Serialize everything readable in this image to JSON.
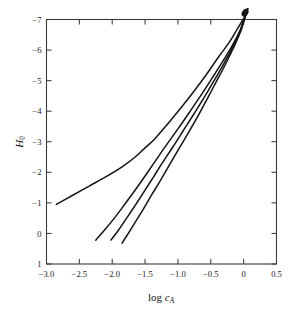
{
  "chart_data": {
    "type": "line",
    "title": "",
    "subtitle": "",
    "xlabel": "log c_A",
    "xlabel_parts": {
      "prefix": "log ",
      "symbol": "c",
      "subscript": "A"
    },
    "ylabel": "H_0",
    "ylabel_parts": {
      "symbol": "H",
      "subscript": "0"
    },
    "xlim": [
      -3.0,
      0.5
    ],
    "ylim": [
      1,
      -7
    ],
    "y_axis_inverted": true,
    "grid": false,
    "legend": null,
    "legend_position": "none",
    "xticks": [
      -3.0,
      -2.5,
      -2.0,
      -1.5,
      -1.0,
      -0.5,
      0,
      0.5
    ],
    "xtick_labels": [
      "-3.0",
      "-2.5",
      "-2.0",
      "-1.5",
      "-1.0",
      "-0.5",
      "0",
      "0.5"
    ],
    "yticks": [
      -7,
      -6,
      -5,
      -4,
      -3,
      -2,
      -1,
      0,
      1
    ],
    "ytick_labels": [
      "-7",
      "-6",
      "-5",
      "-4",
      "-3",
      "-2",
      "-1",
      "0",
      "1"
    ],
    "tick_direction": "in",
    "ticks_on_all_sides": true,
    "line_color": "#141414",
    "axis_color": "#3b3b3b",
    "background_color": "#ffffff",
    "convergence_point": {
      "x": 0.06,
      "y": -7.35
    },
    "series": [
      {
        "name": "curve-1",
        "points": [
          [
            -2.85,
            -0.95
          ],
          [
            -2.6,
            -1.25
          ],
          [
            -2.35,
            -1.55
          ],
          [
            -2.1,
            -1.85
          ],
          [
            -1.85,
            -2.18
          ],
          [
            -1.65,
            -2.5
          ],
          [
            -1.5,
            -2.8
          ],
          [
            -1.35,
            -3.1
          ],
          [
            -1.15,
            -3.6
          ],
          [
            -0.95,
            -4.12
          ],
          [
            -0.75,
            -4.67
          ],
          [
            -0.55,
            -5.25
          ],
          [
            -0.38,
            -5.78
          ],
          [
            -0.22,
            -6.25
          ],
          [
            -0.08,
            -6.75
          ],
          [
            0.02,
            -7.1
          ],
          [
            0.06,
            -7.35
          ]
        ]
      },
      {
        "name": "curve-2",
        "points": [
          [
            -2.25,
            0.22
          ],
          [
            -2.1,
            -0.15
          ],
          [
            -1.95,
            -0.55
          ],
          [
            -1.8,
            -0.98
          ],
          [
            -1.65,
            -1.42
          ],
          [
            -1.5,
            -1.88
          ],
          [
            -1.35,
            -2.35
          ],
          [
            -1.18,
            -2.88
          ],
          [
            -1.0,
            -3.42
          ],
          [
            -0.82,
            -3.98
          ],
          [
            -0.65,
            -4.52
          ],
          [
            -0.48,
            -5.08
          ],
          [
            -0.32,
            -5.62
          ],
          [
            -0.18,
            -6.12
          ],
          [
            -0.06,
            -6.62
          ],
          [
            0.02,
            -7.08
          ],
          [
            0.06,
            -7.35
          ]
        ]
      },
      {
        "name": "curve-3",
        "points": [
          [
            -2.02,
            0.22
          ],
          [
            -1.9,
            -0.12
          ],
          [
            -1.78,
            -0.5
          ],
          [
            -1.65,
            -0.92
          ],
          [
            -1.52,
            -1.35
          ],
          [
            -1.38,
            -1.82
          ],
          [
            -1.24,
            -2.3
          ],
          [
            -1.08,
            -2.82
          ],
          [
            -0.92,
            -3.36
          ],
          [
            -0.76,
            -3.9
          ],
          [
            -0.6,
            -4.45
          ],
          [
            -0.45,
            -5.0
          ],
          [
            -0.3,
            -5.56
          ],
          [
            -0.17,
            -6.08
          ],
          [
            -0.06,
            -6.6
          ],
          [
            0.02,
            -7.08
          ],
          [
            0.06,
            -7.35
          ]
        ]
      },
      {
        "name": "curve-4",
        "points": [
          [
            -1.85,
            0.32
          ],
          [
            -1.75,
            -0.02
          ],
          [
            -1.64,
            -0.4
          ],
          [
            -1.52,
            -0.82
          ],
          [
            -1.4,
            -1.26
          ],
          [
            -1.27,
            -1.72
          ],
          [
            -1.14,
            -2.2
          ],
          [
            -1.0,
            -2.72
          ],
          [
            -0.85,
            -3.26
          ],
          [
            -0.7,
            -3.82
          ],
          [
            -0.56,
            -4.38
          ],
          [
            -0.42,
            -4.95
          ],
          [
            -0.28,
            -5.52
          ],
          [
            -0.16,
            -6.05
          ],
          [
            -0.05,
            -6.58
          ],
          [
            0.02,
            -7.06
          ],
          [
            0.06,
            -7.35
          ]
        ]
      }
    ]
  }
}
